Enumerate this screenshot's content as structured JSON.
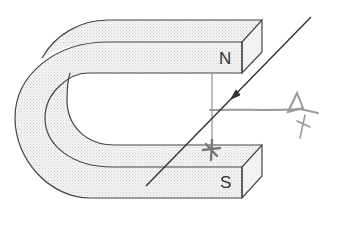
{
  "figure": {
    "labels": {
      "north": "N",
      "south": "S"
    },
    "annotations": {
      "current_arrow": "arrow on wire pointing down-left",
      "observer_eye": "eye symbol viewing along horizontal line",
      "hand_mark": "hand-drawn cross on lower arm top face"
    },
    "colors": {
      "stroke": "#444444",
      "fill": "#eeeeee",
      "pencil": "#9a9a9a",
      "background": "#ffffff"
    }
  }
}
